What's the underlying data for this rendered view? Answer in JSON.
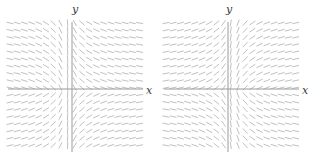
{
  "figure": {
    "kind": "slope-field-pair",
    "background_color": "#ffffff",
    "width": 312,
    "height": 161,
    "panels": [
      {
        "id": "left",
        "name": "left-slope-field",
        "axis_x_label": "x",
        "axis_y_label": "y",
        "axis_color": "#9a9a9a",
        "segment_color": "#b9b9b9",
        "origin_x": 72,
        "origin_y": 89,
        "axis_x_start": 8,
        "axis_x_end": 143,
        "axis_y_start": 22,
        "axis_y_end": 152,
        "label_y_x": 75,
        "label_y_y": 4,
        "label_x_x": 146,
        "label_x_y": 90
      },
      {
        "id": "right",
        "name": "right-slope-field",
        "axis_x_label": "x",
        "axis_y_label": "y",
        "axis_color": "#9a9a9a",
        "segment_color": "#b9b9b9",
        "origin_x": 72,
        "origin_y": 89,
        "axis_x_start": 8,
        "axis_x_end": 143,
        "axis_y_start": 22,
        "axis_y_end": 152,
        "label_y_x": 73,
        "label_y_y": 4,
        "label_x_x": 146,
        "label_x_y": 90
      }
    ]
  },
  "chart_data": {
    "type": "scatter",
    "title": "",
    "xlabel": "x",
    "ylabel": "y",
    "grid": false,
    "legend": "none",
    "plots": [
      {
        "name": "left-slope-field",
        "xlabel": "x",
        "ylabel": "y",
        "xlim": [
          -7.5,
          8
        ],
        "ylim": [
          -7.5,
          7.5
        ],
        "grid_step": 1,
        "segment_length_px": 7,
        "slope_rule": "dy/dx proportional to x (shallow far from the y-axis on the left, steepening to near-vertical just right of the y-axis, mirrored below the x-axis)",
        "slope_model": {
          "form": "angle = -atan(k*(x + 0.6)) for y>0 and +atan(k*(x + 0.6)) for y<0",
          "k": 0.55
        },
        "quadrants": {
          "Q1_upper_right": "slopes negative and steep near the y-axis, flattening toward vertical far right",
          "Q2_upper_left": "slopes shallow, nearly horizontal",
          "Q3_lower_left": "slopes shallow, nearly horizontal",
          "Q4_lower_right": "slopes positive and shallow, flattening to horizontal far right"
        }
      },
      {
        "name": "right-slope-field",
        "xlabel": "x",
        "ylabel": "y",
        "xlim": [
          -7.5,
          8
        ],
        "ylim": [
          -7.5,
          7.5
        ],
        "grid_step": 1,
        "segment_length_px": 7,
        "slope_rule": "mirror image of the left field about the y-axis: steep near-vertical segments left of the y-axis, shallow segments to the right",
        "slope_model": {
          "form": "angle = +atan(k*(x - 0.6)) reflected, producing the mirrored pattern",
          "k": 0.55
        },
        "quadrants": {
          "Q1_upper_right": "slopes shallow and positive, flattening toward horizontal far right",
          "Q2_upper_left": "slopes steep and near-vertical close to the y-axis",
          "Q3_lower_left": "slopes shallow, nearly horizontal far left",
          "Q4_lower_right": "slopes steep and near-vertical close to the y-axis"
        }
      }
    ]
  }
}
